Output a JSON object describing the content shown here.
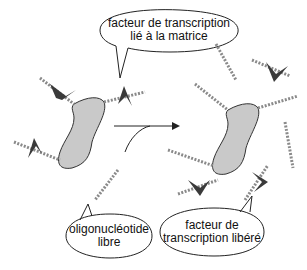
{
  "diagram": {
    "title": "",
    "labels": {
      "bound_factor": [
        "facteur de transcription",
        "lié à la matrice"
      ],
      "free_oligo": [
        "oligonucléotide",
        "libre"
      ],
      "released_factor": [
        "facteur de",
        "transcription libéré"
      ]
    },
    "colors": {
      "matrix_fill": "#c9c9c9",
      "outline": "#333333",
      "factor_fill": "#3a3a3a",
      "dna": "#8a8a8a"
    },
    "nodes": [
      {
        "id": "matrix-left",
        "kind": "matrix"
      },
      {
        "id": "matrix-right",
        "kind": "matrix"
      },
      {
        "id": "bound-factors",
        "kind": "transcription-factor",
        "count": 3
      },
      {
        "id": "free-factors",
        "kind": "transcription-factor",
        "count": 3
      },
      {
        "id": "free-oligos",
        "kind": "oligonucleotide"
      }
    ],
    "edges": [
      {
        "from": "matrix-left",
        "to": "matrix-right",
        "label": "",
        "style": "arrow"
      }
    ]
  }
}
